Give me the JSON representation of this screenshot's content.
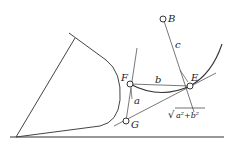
{
  "diagram": {
    "points": {
      "B": "B",
      "F": "F",
      "E": "E",
      "G": "G"
    },
    "segments": {
      "a": "a",
      "b": "b",
      "c": "c"
    },
    "formula": {
      "sqrt_symbol": "√",
      "expr": "a²+b²"
    },
    "colors": {
      "stroke": "#333333",
      "background": "#ffffff"
    }
  }
}
